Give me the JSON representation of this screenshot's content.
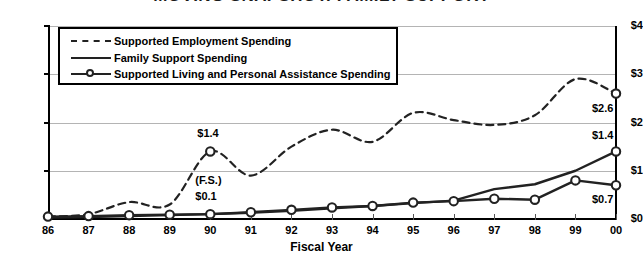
{
  "chart_data": {
    "type": "line",
    "title": "MOVING SNAPSHOT: FAMILY SUPPORT",
    "xlabel": "Fiscal Year",
    "ylabel": "",
    "categories": [
      "86",
      "87",
      "88",
      "89",
      "90",
      "91",
      "92",
      "93",
      "94",
      "95",
      "96",
      "97",
      "98",
      "99",
      "00"
    ],
    "ylim": [
      0,
      4
    ],
    "ytick_labels": [
      "$0",
      "$1",
      "$2",
      "$3",
      "$4"
    ],
    "ytick_values": [
      0,
      1,
      2,
      3,
      4
    ],
    "grid": true,
    "legend_position": "upper-left-inside",
    "series": [
      {
        "name": "Supported Employment Spending",
        "style": "dashed",
        "markers": "endpoints-only",
        "values": [
          0.05,
          0.1,
          0.35,
          0.3,
          1.4,
          0.9,
          1.5,
          1.85,
          1.6,
          2.2,
          2.05,
          1.95,
          2.15,
          2.9,
          2.6
        ]
      },
      {
        "name": "Family Support Spending",
        "style": "solid",
        "markers": "none",
        "values": [
          0.03,
          0.04,
          0.06,
          0.08,
          0.1,
          0.13,
          0.17,
          0.22,
          0.27,
          0.33,
          0.38,
          0.62,
          0.72,
          1.0,
          1.4
        ]
      },
      {
        "name": "Supported Living and Personal Assistance Spending",
        "style": "solid-circles",
        "markers": "circle",
        "values": [
          0.05,
          0.06,
          0.08,
          0.09,
          0.1,
          0.14,
          0.19,
          0.24,
          0.27,
          0.34,
          0.37,
          0.42,
          0.4,
          0.8,
          0.7
        ]
      }
    ],
    "annotations": [
      {
        "label": "$1.4",
        "series": "Supported Employment Spending",
        "x": "90",
        "value": 1.4
      },
      {
        "label": "(F.S.)",
        "series": "Family Support Spending",
        "x": "90",
        "value": 0.1
      },
      {
        "label": "$0.1",
        "series": "Family Support Spending",
        "x": "90",
        "value": 0.1
      },
      {
        "label": "$2.6",
        "series": "Supported Employment Spending",
        "x": "00",
        "value": 2.6
      },
      {
        "label": "$1.4",
        "series": "Family Support Spending",
        "x": "00",
        "value": 1.4
      },
      {
        "label": "$0.7",
        "series": "Supported Living and Personal Assistance Spending",
        "x": "00",
        "value": 0.7
      }
    ]
  },
  "colors": {
    "line": "#222222",
    "grid": "#b4b4b4",
    "axis": "#000000",
    "background": "#ffffff"
  }
}
